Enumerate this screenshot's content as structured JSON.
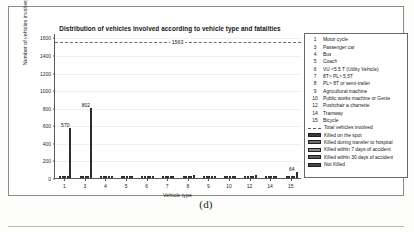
{
  "figure": {
    "caption": "(d)"
  },
  "chart_data": {
    "type": "bar",
    "title": "Distribution of vehicles involved according to vehicle type and fatalities",
    "xlabel": "Vehicle type",
    "ylabel": "Number of vehicles involved",
    "categories": [
      "1",
      "3",
      "4",
      "5",
      "6",
      "7",
      "8",
      "9",
      "10",
      "12",
      "14",
      "15"
    ],
    "yticks": [
      0,
      200,
      400,
      600,
      800,
      1000,
      1200,
      1400,
      1600
    ],
    "ylim": [
      0,
      1650
    ],
    "grid": true,
    "legend_position": "right-outside",
    "reference_line": {
      "label": "1563",
      "value": 1563,
      "name": "Total vehicles involved",
      "style": "dashed"
    },
    "series": [
      {
        "name": "Killed on the spot",
        "values": [
          4,
          3,
          1,
          1,
          1,
          2,
          2,
          1,
          1,
          1,
          1,
          2
        ]
      },
      {
        "name": "Killed during transfer to hospital",
        "values": [
          3,
          2,
          1,
          1,
          1,
          1,
          1,
          1,
          1,
          1,
          1,
          1
        ]
      },
      {
        "name": "Killed within 7 days of accident",
        "values": [
          2,
          2,
          1,
          1,
          1,
          1,
          1,
          1,
          1,
          1,
          1,
          1
        ]
      },
      {
        "name": "Killed within 30 days of accident",
        "values": [
          3,
          2,
          1,
          1,
          2,
          2,
          2,
          1,
          1,
          2,
          1,
          3
        ]
      },
      {
        "name": "Not Killed",
        "values": [
          570,
          802,
          9,
          10,
          14,
          26,
          34,
          18,
          22,
          30,
          12,
          64
        ]
      }
    ],
    "data_labels": [
      {
        "category": "1",
        "value": 570,
        "text": "570"
      },
      {
        "category": "3",
        "value": 802,
        "text": "802"
      },
      {
        "category": "15",
        "value": 64,
        "text": "64"
      }
    ]
  },
  "legend": {
    "vehicle_types": [
      {
        "key": "1",
        "label": "Motor cycle"
      },
      {
        "key": "3",
        "label": "Passenger car"
      },
      {
        "key": "4",
        "label": "Bus"
      },
      {
        "key": "5",
        "label": "Coach"
      },
      {
        "key": "6",
        "label": "VU <5.5 T (Utility Vehicle)"
      },
      {
        "key": "7",
        "label": "8T> PL> 5,5T"
      },
      {
        "key": "8",
        "label": "PL> 8T or semi-trailer"
      },
      {
        "key": "9",
        "label": "Agricultural machine"
      },
      {
        "key": "10",
        "label": "Public works machine or Genie"
      },
      {
        "key": "12",
        "label": "Pushchair a charrette"
      },
      {
        "key": "14",
        "label": "Tramway"
      },
      {
        "key": "15",
        "label": "Bicycle"
      }
    ],
    "series_entries": [
      {
        "label": "Total vehicles involved",
        "swatch": "dashed-line"
      },
      {
        "label": "Killed on the spot",
        "swatch": "bar-fill-0"
      },
      {
        "label": "Killed during transfer to hospital",
        "swatch": "bar-fill-1"
      },
      {
        "label": "Killed within 7 days of accident",
        "swatch": "bar-fill-2"
      },
      {
        "label": "Killed within 30 days of accident",
        "swatch": "bar-fill-3"
      },
      {
        "label": "Not Killed",
        "swatch": "bar-fill-4"
      }
    ]
  },
  "colors": {
    "axis": "#5a5a5a",
    "grid": "#efefef",
    "reference_line": "#6d6d6d",
    "bar_dark": "#3a3a3a",
    "background": "#ffffff"
  }
}
